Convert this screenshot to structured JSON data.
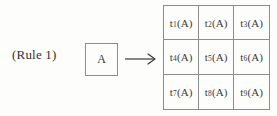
{
  "figure": {
    "rule_label": "(Rule 1)",
    "source": {
      "symbol": "A"
    },
    "arrow": {
      "direction": "right",
      "icon": "arrow-right-icon"
    },
    "result_grid": {
      "rows": 3,
      "columns": 3,
      "cells": [
        {
          "base": "t",
          "subscript": "1",
          "argument": "(A)",
          "text": "t1(A)"
        },
        {
          "base": "t",
          "subscript": "2",
          "argument": "(A)",
          "text": "t2(A)"
        },
        {
          "base": "t",
          "subscript": "3",
          "argument": "(A)",
          "text": "t3(A)"
        },
        {
          "base": "t",
          "subscript": "4",
          "argument": "(A)",
          "text": "t4(A)"
        },
        {
          "base": "t",
          "subscript": "5",
          "argument": "(A)",
          "text": "t5(A)"
        },
        {
          "base": "t",
          "subscript": "6",
          "argument": "(A)",
          "text": "t6(A)"
        },
        {
          "base": "t",
          "subscript": "7",
          "argument": "(A)",
          "text": "t7(A)"
        },
        {
          "base": "t",
          "subscript": "8",
          "argument": "(A)",
          "text": "t8(A)"
        },
        {
          "base": "t",
          "subscript": "9",
          "argument": "(A)",
          "text": "t9(A)"
        }
      ]
    },
    "colors": {
      "ink": "#3a3a3a",
      "rule_line": "#8d8d8d",
      "paper": "#fdfdfb"
    }
  }
}
